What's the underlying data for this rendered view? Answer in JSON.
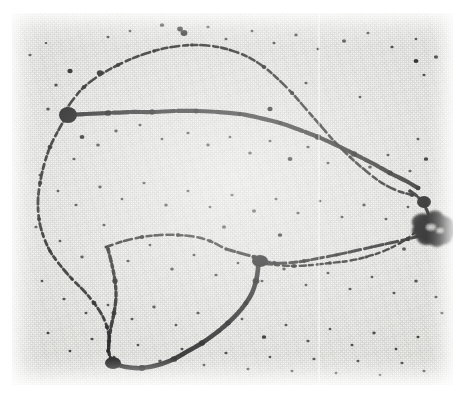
{
  "figure": {
    "kind": "electron-micrograph",
    "subject": "branched circular DNA molecule (theta / looped form) on support film",
    "plate": {
      "x": 12,
      "y": 13,
      "width": 441,
      "height": 372,
      "background_color": "#efefec",
      "border_color": "#ffffff"
    },
    "colors": {
      "background": "#efefec",
      "grain_dark": "#9a9a9a",
      "strand": "#101010",
      "blob": "#080808",
      "page": "#ffffff",
      "scanline": "#ffffff"
    },
    "artifacts": [
      {
        "name": "vertical-scan-line",
        "x": 318,
        "description": "faint vertical lighter seam"
      }
    ]
  },
  "chart_data": {
    "type": "scatter",
    "title": "",
    "xlabel": "",
    "ylabel": "",
    "xlim": [
      0,
      441
    ],
    "ylim": [
      0,
      372
    ],
    "grid": false,
    "legend": false,
    "note": "coordinates are in plate-local pixels; strands are polyline traces of the filament, specks are particulate noise",
    "strands": [
      {
        "name": "upper-outer-arc",
        "thickness": 2.6,
        "dash": "6 3 9 4 5 3",
        "points": [
          [
            52,
            100
          ],
          [
            60,
            88
          ],
          [
            72,
            74
          ],
          [
            88,
            62
          ],
          [
            106,
            52
          ],
          [
            124,
            44
          ],
          [
            142,
            38
          ],
          [
            160,
            34
          ],
          [
            180,
            32
          ],
          [
            200,
            33
          ],
          [
            218,
            37
          ],
          [
            236,
            44
          ],
          [
            252,
            54
          ],
          [
            266,
            66
          ],
          [
            280,
            80
          ],
          [
            294,
            96
          ],
          [
            308,
            112
          ],
          [
            322,
            128
          ],
          [
            338,
            144
          ],
          [
            354,
            158
          ],
          [
            370,
            170
          ],
          [
            386,
            178
          ],
          [
            400,
            182
          ]
        ]
      },
      {
        "name": "mid-heavy-strand",
        "thickness": 4.2,
        "dash": "18 2 24 3 16 2",
        "points": [
          [
            54,
            102
          ],
          [
            74,
            101
          ],
          [
            96,
            100
          ],
          [
            118,
            99
          ],
          [
            140,
            99
          ],
          [
            162,
            98
          ],
          [
            184,
            98
          ],
          [
            206,
            99
          ],
          [
            228,
            101
          ],
          [
            248,
            105
          ],
          [
            268,
            110
          ],
          [
            288,
            117
          ],
          [
            306,
            124
          ],
          [
            324,
            132
          ],
          [
            342,
            141
          ],
          [
            360,
            150
          ],
          [
            378,
            160
          ],
          [
            394,
            168
          ],
          [
            406,
            175
          ]
        ]
      },
      {
        "name": "left-descending-arc",
        "thickness": 2.8,
        "dash": "5 3 7 3 4 4",
        "points": [
          [
            54,
            104
          ],
          [
            46,
            118
          ],
          [
            38,
            134
          ],
          [
            32,
            152
          ],
          [
            28,
            170
          ],
          [
            26,
            188
          ],
          [
            27,
            206
          ],
          [
            31,
            222
          ],
          [
            38,
            238
          ],
          [
            48,
            252
          ],
          [
            60,
            266
          ],
          [
            72,
            278
          ],
          [
            82,
            290
          ],
          [
            90,
            302
          ],
          [
            95,
            314
          ],
          [
            97,
            326
          ],
          [
            96,
            338
          ]
        ]
      },
      {
        "name": "inner-loop-left-branch",
        "thickness": 3.4,
        "dash": "4 3 6 3 3 3",
        "points": [
          [
            96,
            236
          ],
          [
            100,
            252
          ],
          [
            103,
            268
          ],
          [
            104,
            284
          ],
          [
            102,
            300
          ],
          [
            99,
            314
          ],
          [
            97,
            328
          ],
          [
            97,
            340
          ],
          [
            100,
            348
          ]
        ]
      },
      {
        "name": "inner-loop-top",
        "thickness": 2.6,
        "dash": "7 4 5 3 8 4",
        "points": [
          [
            94,
            234
          ],
          [
            112,
            228
          ],
          [
            130,
            224
          ],
          [
            148,
            222
          ],
          [
            166,
            222
          ],
          [
            184,
            224
          ],
          [
            198,
            228
          ],
          [
            210,
            234
          ]
        ]
      },
      {
        "name": "inner-loop-bottom-heavy",
        "thickness": 4.6,
        "dash": "26 2 30 2",
        "points": [
          [
            100,
            350
          ],
          [
            114,
            354
          ],
          [
            130,
            355
          ],
          [
            146,
            352
          ],
          [
            162,
            346
          ],
          [
            176,
            338
          ],
          [
            190,
            330
          ],
          [
            204,
            320
          ],
          [
            216,
            310
          ],
          [
            226,
            300
          ],
          [
            234,
            290
          ],
          [
            240,
            280
          ],
          [
            244,
            268
          ],
          [
            246,
            256
          ],
          [
            246,
            246
          ]
        ]
      },
      {
        "name": "mid-right-strand",
        "thickness": 3.0,
        "dash": "9 3 12 4 7 3",
        "points": [
          [
            214,
            236
          ],
          [
            228,
            240
          ],
          [
            242,
            244
          ],
          [
            252,
            248
          ],
          [
            262,
            250
          ],
          [
            276,
            250
          ],
          [
            292,
            248
          ],
          [
            308,
            245
          ],
          [
            324,
            242
          ],
          [
            342,
            238
          ],
          [
            360,
            234
          ],
          [
            378,
            230
          ],
          [
            396,
            226
          ],
          [
            410,
            222
          ]
        ]
      },
      {
        "name": "lower-right-converge",
        "thickness": 2.4,
        "dash": "4 4 6 3",
        "points": [
          [
            246,
            250
          ],
          [
            264,
            252
          ],
          [
            282,
            253
          ],
          [
            300,
            252
          ],
          [
            318,
            250
          ],
          [
            336,
            248
          ],
          [
            354,
            244
          ],
          [
            372,
            238
          ],
          [
            388,
            230
          ],
          [
            400,
            222
          ],
          [
            408,
            214
          ]
        ]
      },
      {
        "name": "right-tail-to-blob",
        "thickness": 3.2,
        "dash": "8 3 10 3",
        "points": [
          [
            398,
            178
          ],
          [
            406,
            184
          ],
          [
            412,
            192
          ],
          [
            416,
            200
          ],
          [
            418,
            208
          ]
        ]
      }
    ],
    "nodes": [
      {
        "name": "left-junction",
        "x": 56,
        "y": 102,
        "rx": 9,
        "ry": 8
      },
      {
        "name": "mid-junction",
        "x": 248,
        "y": 248,
        "rx": 8,
        "ry": 6
      },
      {
        "name": "bottom-corner",
        "x": 101,
        "y": 350,
        "rx": 8,
        "ry": 6
      },
      {
        "name": "right-node",
        "x": 412,
        "y": 189,
        "rx": 7,
        "ry": 6
      }
    ],
    "aggregate_blob": {
      "name": "dense-aggregate",
      "cx": 422,
      "cy": 215,
      "rx": 20,
      "ry": 17
    },
    "specks": [
      [
        18,
        42,
        1.6
      ],
      [
        34,
        30,
        1.3
      ],
      [
        58,
        58,
        2.6
      ],
      [
        44,
        72,
        1.8
      ],
      [
        96,
        24,
        1.5
      ],
      [
        118,
        18,
        1.4
      ],
      [
        150,
        12,
        2.2
      ],
      [
        172,
        20,
        3.4
      ],
      [
        196,
        14,
        1.6
      ],
      [
        214,
        26,
        1.5
      ],
      [
        240,
        18,
        1.4
      ],
      [
        262,
        30,
        1.5
      ],
      [
        284,
        22,
        1.7
      ],
      [
        306,
        36,
        1.4
      ],
      [
        332,
        28,
        2.0
      ],
      [
        356,
        20,
        1.5
      ],
      [
        380,
        34,
        1.6
      ],
      [
        404,
        26,
        1.4
      ],
      [
        424,
        44,
        2.1
      ],
      [
        412,
        62,
        1.5
      ],
      [
        36,
        96,
        1.8
      ],
      [
        70,
        124,
        2.4
      ],
      [
        86,
        132,
        1.9
      ],
      [
        62,
        146,
        1.6
      ],
      [
        104,
        118,
        1.7
      ],
      [
        128,
        112,
        1.5
      ],
      [
        150,
        126,
        1.4
      ],
      [
        176,
        120,
        1.6
      ],
      [
        196,
        132,
        1.7
      ],
      [
        218,
        124,
        1.4
      ],
      [
        238,
        140,
        1.8
      ],
      [
        258,
        128,
        1.5
      ],
      [
        278,
        146,
        2.4
      ],
      [
        296,
        134,
        1.6
      ],
      [
        316,
        150,
        1.5
      ],
      [
        338,
        138,
        1.4
      ],
      [
        358,
        154,
        1.9
      ],
      [
        376,
        142,
        1.5
      ],
      [
        398,
        158,
        1.6
      ],
      [
        414,
        146,
        2.2
      ],
      [
        28,
        162,
        1.5
      ],
      [
        46,
        178,
        1.4
      ],
      [
        64,
        192,
        1.6
      ],
      [
        88,
        174,
        1.7
      ],
      [
        110,
        186,
        1.4
      ],
      [
        132,
        170,
        1.5
      ],
      [
        154,
        192,
        1.8
      ],
      [
        176,
        178,
        1.5
      ],
      [
        198,
        194,
        1.4
      ],
      [
        220,
        182,
        1.6
      ],
      [
        242,
        198,
        2.0
      ],
      [
        264,
        186,
        1.5
      ],
      [
        286,
        200,
        1.6
      ],
      [
        308,
        188,
        1.4
      ],
      [
        330,
        204,
        1.5
      ],
      [
        352,
        192,
        1.7
      ],
      [
        374,
        206,
        1.5
      ],
      [
        396,
        194,
        1.4
      ],
      [
        24,
        214,
        1.6
      ],
      [
        48,
        228,
        1.4
      ],
      [
        70,
        244,
        1.7
      ],
      [
        92,
        212,
        1.5
      ],
      [
        116,
        248,
        1.6
      ],
      [
        138,
        232,
        1.4
      ],
      [
        160,
        256,
        1.8
      ],
      [
        182,
        242,
        1.5
      ],
      [
        204,
        262,
        1.6
      ],
      [
        226,
        250,
        1.4
      ],
      [
        250,
        268,
        1.5
      ],
      [
        272,
        256,
        1.7
      ],
      [
        294,
        272,
        1.4
      ],
      [
        316,
        260,
        1.5
      ],
      [
        338,
        276,
        1.6
      ],
      [
        360,
        264,
        1.4
      ],
      [
        382,
        280,
        1.5
      ],
      [
        404,
        268,
        1.8
      ],
      [
        424,
        284,
        1.5
      ],
      [
        30,
        268,
        1.4
      ],
      [
        52,
        286,
        1.6
      ],
      [
        74,
        300,
        1.5
      ],
      [
        96,
        292,
        1.4
      ],
      [
        120,
        306,
        1.5
      ],
      [
        142,
        294,
        1.7
      ],
      [
        164,
        312,
        1.4
      ],
      [
        186,
        300,
        1.6
      ],
      [
        208,
        318,
        1.5
      ],
      [
        230,
        306,
        1.4
      ],
      [
        252,
        324,
        2.2
      ],
      [
        274,
        312,
        1.5
      ],
      [
        296,
        328,
        1.6
      ],
      [
        318,
        316,
        1.4
      ],
      [
        340,
        332,
        1.5
      ],
      [
        362,
        320,
        1.7
      ],
      [
        384,
        336,
        1.4
      ],
      [
        406,
        324,
        1.5
      ],
      [
        36,
        320,
        1.5
      ],
      [
        58,
        338,
        1.4
      ],
      [
        80,
        326,
        1.6
      ],
      [
        102,
        344,
        1.5
      ],
      [
        126,
        332,
        1.4
      ],
      [
        148,
        348,
        1.8
      ],
      [
        170,
        336,
        1.5
      ],
      [
        192,
        352,
        1.4
      ],
      [
        214,
        340,
        1.6
      ],
      [
        236,
        356,
        1.5
      ],
      [
        258,
        344,
        1.4
      ],
      [
        280,
        358,
        1.5
      ],
      [
        302,
        346,
        1.6
      ],
      [
        324,
        360,
        1.4
      ],
      [
        346,
        348,
        1.5
      ],
      [
        368,
        362,
        1.4
      ],
      [
        390,
        350,
        1.6
      ],
      [
        412,
        358,
        1.5
      ],
      [
        88,
        60,
        3.2
      ],
      [
        168,
        16,
        2.8
      ],
      [
        404,
        48,
        2.4
      ],
      [
        258,
        96,
        2.6
      ],
      [
        212,
        214,
        2.0
      ],
      [
        268,
        222,
        2.2
      ],
      [
        392,
        236,
        2.0
      ],
      [
        430,
        300,
        1.6
      ],
      [
        406,
        126,
        1.5
      ],
      [
        348,
        84,
        1.4
      ],
      [
        294,
        70,
        1.6
      ]
    ]
  }
}
